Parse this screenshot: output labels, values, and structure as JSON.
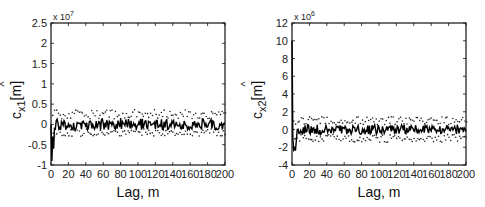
{
  "chart_data": [
    {
      "type": "line",
      "title": "",
      "xlabel": "Lag, m",
      "ylabel": "ĉx1[m]",
      "ylabel_main": "c",
      "ylabel_sub": "x1",
      "ylabel_unit": "[m]",
      "y_multiplier": "x 10",
      "y_multiplier_exp": "7",
      "xlim": [
        0,
        200
      ],
      "ylim": [
        -1,
        2.5
      ],
      "xticks": [
        0,
        20,
        40,
        60,
        80,
        100,
        120,
        140,
        160,
        180,
        200
      ],
      "yticks": [
        -1,
        -0.5,
        0,
        0.5,
        1,
        1.5,
        2,
        2.5
      ],
      "ytick_labels": [
        "-1",
        "-0.5",
        "0",
        "0.5",
        "1",
        "1.5",
        "2",
        "2.5"
      ],
      "grid": false,
      "series": [
        {
          "name": "estimate",
          "style": "solid",
          "description": "spike near -0.9 at lag ~2, then fluctuates around 0 with amplitude ~0.15"
        },
        {
          "name": "upper bound",
          "style": "dots",
          "level": 0.25
        },
        {
          "name": "lower bound",
          "style": "dots",
          "level": -0.2
        }
      ]
    },
    {
      "type": "line",
      "title": "",
      "xlabel": "Lag, m",
      "ylabel": "ĉx2[m]",
      "ylabel_main": "c",
      "ylabel_sub": "x2",
      "ylabel_unit": "[m]",
      "y_multiplier": "x 10",
      "y_multiplier_exp": "6",
      "xlim": [
        0,
        200
      ],
      "ylim": [
        -4,
        12
      ],
      "xticks": [
        0,
        20,
        40,
        60,
        80,
        100,
        120,
        140,
        160,
        180,
        200
      ],
      "yticks": [
        -4,
        -2,
        0,
        2,
        4,
        6,
        8,
        10,
        12
      ],
      "ytick_labels": [
        "-4",
        "-2",
        "0",
        "2",
        "4",
        "6",
        "8",
        "10",
        "12"
      ],
      "grid": false,
      "series": [
        {
          "name": "estimate",
          "style": "solid",
          "description": "spike at lag 0 near 10, dip to ~-2.3 around lag 3-5, then fluctuates around 0 with amplitude ~0.6"
        },
        {
          "name": "upper bound",
          "style": "dots",
          "level": 1.0
        },
        {
          "name": "lower bound",
          "style": "dots",
          "level": -1.0
        }
      ]
    }
  ]
}
